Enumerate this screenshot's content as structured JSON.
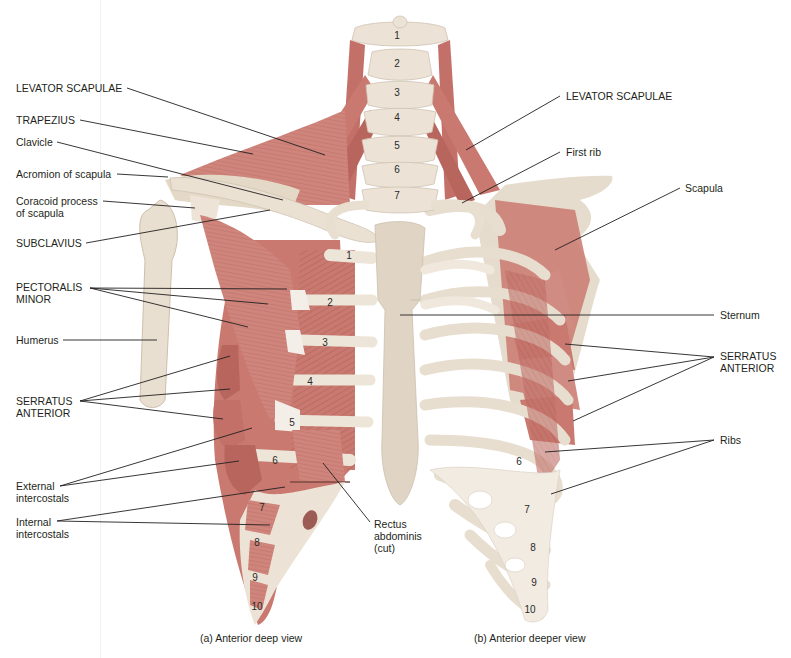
{
  "colors": {
    "muscle": "#c9796f",
    "muscle_dark": "#a85a52",
    "muscle_light": "#dea39a",
    "bone": "#ece3d6",
    "bone_shadow": "#cfc3b2",
    "tendon": "#f4eee8",
    "leader": "#231f20",
    "text": "#231f20"
  },
  "figure": {
    "panels": [
      {
        "id": "a",
        "caption": "(a) Anterior deep view"
      },
      {
        "id": "b",
        "caption": "(b) Anterior deeper view"
      }
    ]
  },
  "labels_left": [
    {
      "id": "levator-scapulae-left",
      "text": "LEVATOR SCAPULAE",
      "x": 16,
      "y": 82,
      "line": [
        [
          127,
          88
        ],
        [
          325,
          155
        ]
      ]
    },
    {
      "id": "trapezius",
      "text": "TRAPEZIUS",
      "x": 16,
      "y": 114,
      "line": [
        [
          80,
          120
        ],
        [
          253,
          154
        ]
      ]
    },
    {
      "id": "clavicle",
      "text": "Clavicle",
      "x": 16,
      "y": 136,
      "line": [
        [
          57,
          142
        ],
        [
          283,
          200
        ]
      ]
    },
    {
      "id": "acromion-of-scapula",
      "text": "Acromion of scapula",
      "x": 16,
      "y": 168,
      "line": [
        [
          117,
          174
        ],
        [
          168,
          177
        ]
      ]
    },
    {
      "id": "coracoid-process",
      "text": "Coracoid process\nof scapula",
      "x": 16,
      "y": 195,
      "line": [
        [
          103,
          201
        ],
        [
          195,
          208
        ]
      ]
    },
    {
      "id": "subclavius",
      "text": "SUBCLAVIUS",
      "x": 16,
      "y": 237,
      "line": [
        [
          86,
          243
        ],
        [
          270,
          210
        ]
      ]
    },
    {
      "id": "pectoralis-minor",
      "text": "PECTORALIS\nMINOR",
      "x": 16,
      "y": 281,
      "lines": [
        [
          [
            90,
            288
          ],
          [
            287,
            289
          ]
        ],
        [
          [
            90,
            288
          ],
          [
            268,
            304
          ]
        ],
        [
          [
            90,
            288
          ],
          [
            248,
            327
          ]
        ]
      ]
    },
    {
      "id": "humerus",
      "text": "Humerus",
      "x": 16,
      "y": 334,
      "line": [
        [
          63,
          340
        ],
        [
          157,
          340
        ]
      ]
    },
    {
      "id": "serratus-anterior-left",
      "text": "SERRATUS\nANTERIOR",
      "x": 16,
      "y": 398,
      "lines": [
        [
          [
            80,
            401
          ],
          [
            230,
            356
          ]
        ],
        [
          [
            80,
            401
          ],
          [
            230,
            389
          ]
        ],
        [
          [
            80,
            401
          ],
          [
            223,
            419
          ]
        ]
      ]
    },
    {
      "id": "external-intercostals",
      "text": "External\nintercostals",
      "x": 16,
      "y": 480,
      "lines": [
        [
          [
            60,
            486
          ],
          [
            252,
            428
          ]
        ],
        [
          [
            60,
            486
          ],
          [
            239,
            461
          ]
        ]
      ]
    },
    {
      "id": "internal-intercostals",
      "text": "Internal\nintercostals",
      "x": 16,
      "y": 516,
      "lines": [
        [
          [
            57,
            521
          ],
          [
            285,
            487
          ]
        ],
        [
          [
            57,
            521
          ],
          [
            270,
            525
          ]
        ]
      ]
    },
    {
      "id": "rectus-abdominis",
      "text": "Rectus\nabdominis\n(cut)",
      "x": 374,
      "y": 518,
      "line": [
        [
          323,
          463
        ],
        [
          370,
          522
        ]
      ]
    }
  ],
  "labels_right": [
    {
      "id": "levator-scapulae-right",
      "text": "LEVATOR SCAPULAE",
      "x": 566,
      "y": 90,
      "line": [
        [
          560,
          96
        ],
        [
          466,
          150
        ]
      ]
    },
    {
      "id": "first-rib",
      "text": "First rib",
      "x": 566,
      "y": 146,
      "line": [
        [
          560,
          152
        ],
        [
          462,
          203
        ]
      ]
    },
    {
      "id": "scapula",
      "text": "Scapula",
      "x": 685,
      "y": 182,
      "line": [
        [
          680,
          188
        ],
        [
          555,
          250
        ]
      ]
    },
    {
      "id": "sternum",
      "text": "Sternum",
      "x": 720,
      "y": 309,
      "line": [
        [
          714,
          315
        ],
        [
          400,
          315
        ]
      ]
    },
    {
      "id": "serratus-anterior-right",
      "text": "SERRATUS\nANTERIOR",
      "x": 720,
      "y": 350,
      "lines": [
        [
          [
            714,
            357
          ],
          [
            565,
            344
          ]
        ],
        [
          [
            714,
            357
          ],
          [
            568,
            381
          ]
        ],
        [
          [
            714,
            357
          ],
          [
            573,
            421
          ]
        ]
      ]
    },
    {
      "id": "ribs",
      "text": "Ribs",
      "x": 720,
      "y": 434,
      "lines": [
        [
          [
            714,
            440
          ],
          [
            545,
            452
          ]
        ],
        [
          [
            714,
            440
          ],
          [
            551,
            494
          ]
        ]
      ]
    }
  ],
  "vertebrae": [
    {
      "n": "1",
      "x": 397,
      "y": 39
    },
    {
      "n": "2",
      "x": 397,
      "y": 67
    },
    {
      "n": "3",
      "x": 397,
      "y": 96
    },
    {
      "n": "4",
      "x": 397,
      "y": 121
    },
    {
      "n": "5",
      "x": 397,
      "y": 149
    },
    {
      "n": "6",
      "x": 397,
      "y": 173
    },
    {
      "n": "7",
      "x": 397,
      "y": 199
    }
  ],
  "rib_numbers_a": [
    {
      "n": "1",
      "x": 349,
      "y": 259
    },
    {
      "n": "2",
      "x": 330,
      "y": 306
    },
    {
      "n": "3",
      "x": 325,
      "y": 346
    },
    {
      "n": "4",
      "x": 310,
      "y": 385
    },
    {
      "n": "5",
      "x": 292,
      "y": 426
    },
    {
      "n": "6",
      "x": 275,
      "y": 464
    },
    {
      "n": "7",
      "x": 262,
      "y": 511
    },
    {
      "n": "8",
      "x": 257,
      "y": 546
    },
    {
      "n": "9",
      "x": 255,
      "y": 581
    },
    {
      "n": "10",
      "x": 257,
      "y": 610
    }
  ],
  "rib_numbers_b": [
    {
      "n": "6",
      "x": 519,
      "y": 465
    },
    {
      "n": "7",
      "x": 527,
      "y": 513
    },
    {
      "n": "8",
      "x": 533,
      "y": 551
    },
    {
      "n": "9",
      "x": 534,
      "y": 586
    },
    {
      "n": "10",
      "x": 530,
      "y": 613
    }
  ]
}
